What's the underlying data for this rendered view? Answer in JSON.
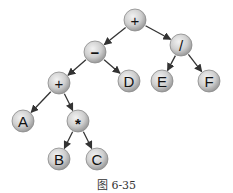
{
  "diagram": {
    "type": "expression-tree",
    "caption": "图 6-35",
    "node_fill": "#c8c8c8",
    "edge_color": "#333333",
    "nodes": [
      {
        "id": "n0",
        "label": "+",
        "x": 135,
        "y": 20
      },
      {
        "id": "n1",
        "label": "−",
        "x": 95,
        "y": 52
      },
      {
        "id": "n2",
        "label": "/",
        "x": 181,
        "y": 45
      },
      {
        "id": "n3",
        "label": "+",
        "x": 59,
        "y": 83
      },
      {
        "id": "n4",
        "label": "D",
        "x": 129,
        "y": 81
      },
      {
        "id": "n5",
        "label": "E",
        "x": 162,
        "y": 81
      },
      {
        "id": "n6",
        "label": "F",
        "x": 209,
        "y": 81
      },
      {
        "id": "n7",
        "label": "A",
        "x": 23,
        "y": 121
      },
      {
        "id": "n8",
        "label": "*",
        "x": 78,
        "y": 121
      },
      {
        "id": "n9",
        "label": "B",
        "x": 59,
        "y": 159
      },
      {
        "id": "n10",
        "label": "C",
        "x": 97,
        "y": 159
      }
    ],
    "edges": [
      [
        "n0",
        "n1"
      ],
      [
        "n0",
        "n2"
      ],
      [
        "n1",
        "n3"
      ],
      [
        "n1",
        "n4"
      ],
      [
        "n2",
        "n5"
      ],
      [
        "n2",
        "n6"
      ],
      [
        "n3",
        "n7"
      ],
      [
        "n3",
        "n8"
      ],
      [
        "n8",
        "n9"
      ],
      [
        "n8",
        "n10"
      ]
    ]
  }
}
